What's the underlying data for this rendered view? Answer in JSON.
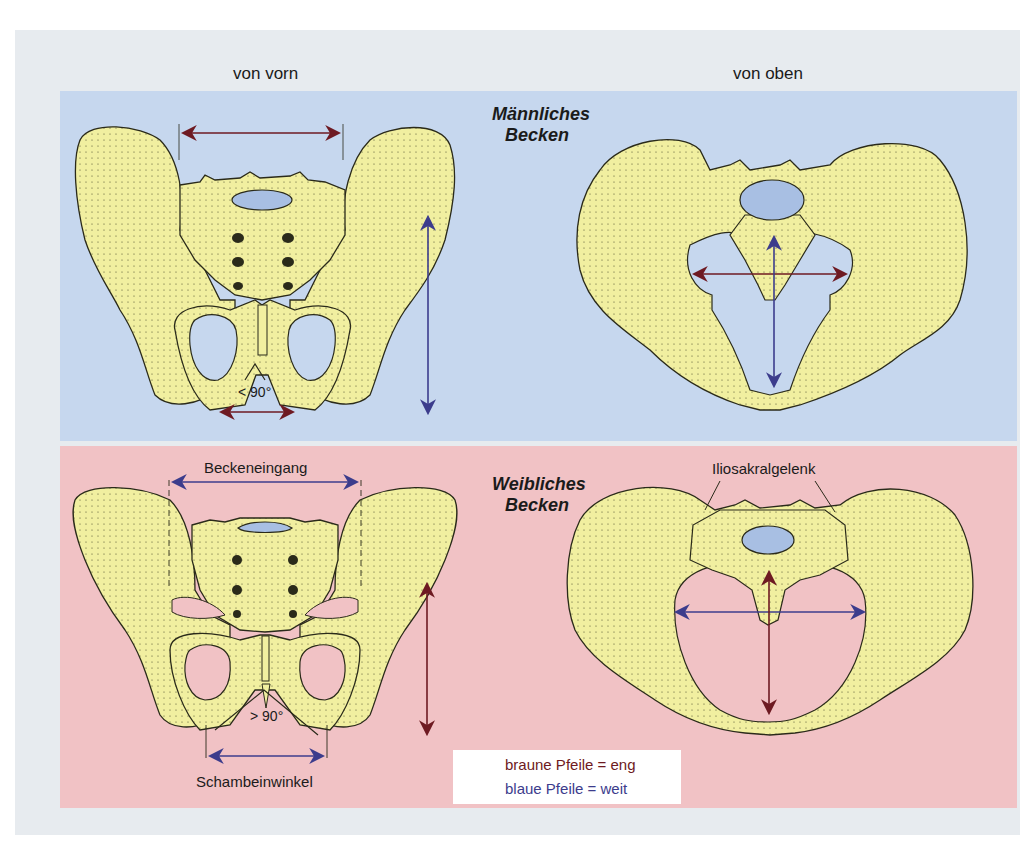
{
  "column_headers": {
    "front_view": "von vorn",
    "top_view": "von oben"
  },
  "panels": {
    "male": {
      "title_line1": "Männliches",
      "title_line2": "Becken",
      "background": "#c6d7ee",
      "pubic_angle_label": "< 90°"
    },
    "female": {
      "title_line1": "Weibliches",
      "title_line2": "Becken",
      "background": "#f1c2c5",
      "pubic_angle_label": "> 90°",
      "pelvic_inlet_label": "Beckeneingang",
      "pubic_angle_name": "Schambeinwinkel",
      "sacroiliac_joint_label": "Iliosakralgelenk"
    }
  },
  "legend": {
    "brown": {
      "text": "braune Pfeile = eng",
      "color": "#6e1a22"
    },
    "blue": {
      "text": "blaue Pfeile = weit",
      "color": "#3c3c8c"
    }
  },
  "colors": {
    "bone": "#f1efa0",
    "bone_outline": "#2a2a1a",
    "vertebra_disc": "#a8bfe3",
    "frame": "#e7ebef"
  }
}
